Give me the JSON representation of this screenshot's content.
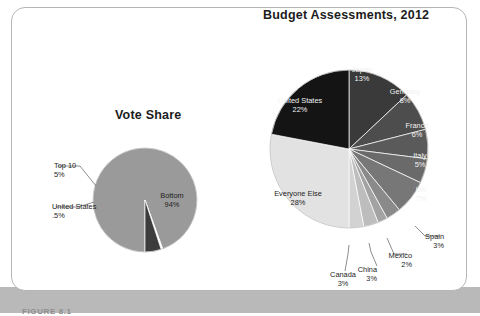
{
  "figure": {
    "caption": "FIGURE 8.1",
    "card_border_color": "#b5b5b5",
    "band_color": "#b9b9b9"
  },
  "chart_data": [
    {
      "type": "pie",
      "title": "Vote Share",
      "id": "vote-share",
      "center": [
        145,
        200
      ],
      "radius": 52,
      "start_angle_deg": 180,
      "direction": "clockwise",
      "categories": [
        "Bottom",
        "United States",
        "Top 10"
      ],
      "values": [
        94,
        0.5,
        5
      ],
      "value_labels": [
        "94%",
        ".5%",
        "5%"
      ],
      "colors": [
        "#9a9a9a",
        "#ffffff",
        "#3c3c3c"
      ],
      "slices": [
        {
          "name": "Bottom",
          "value": 94,
          "value_label": "94%",
          "color": "#9a9a9a",
          "label_mode": "inside",
          "label_color": "#1d1d1d",
          "label_xy": [
            172,
            196
          ]
        },
        {
          "name": "United States",
          "value": 0.5,
          "value_label": ".5%",
          "color": "#ffffff",
          "label_mode": "callout",
          "label_color": "#1d1d1d",
          "text_xy": [
            52,
            209
          ],
          "leader": [
            [
              56,
              207
            ],
            [
              78,
              207
            ],
            [
              94,
              202
            ]
          ]
        },
        {
          "name": "Top 10",
          "value": 5,
          "value_label": "5%",
          "color": "#3c3c3c",
          "label_mode": "callout",
          "label_color": "#1d1d1d",
          "text_xy": [
            54,
            168
          ],
          "leader": [
            [
              58,
              166
            ],
            [
              80,
              166
            ],
            [
              96,
              186
            ]
          ]
        }
      ],
      "legend": "none",
      "grid": false
    },
    {
      "type": "pie",
      "title": "Budget Assessments, 2012",
      "id": "budget-assessments",
      "center": [
        349,
        149
      ],
      "radius": 79,
      "start_angle_deg": 0,
      "direction": "clockwise",
      "categories": [
        "Japan",
        "Germany",
        "France",
        "Italy",
        "UK",
        "Spain",
        "Mexico",
        "China",
        "Canada",
        "Everyone Else",
        "United States"
      ],
      "values": [
        13,
        8,
        6,
        5,
        7,
        3,
        2,
        3,
        3,
        28,
        22
      ],
      "value_labels": [
        "13%",
        "8%",
        "6%",
        "5%",
        "7%",
        "3%",
        "2%",
        "3%",
        "3%",
        "28%",
        "22%"
      ],
      "colors": [
        "#3a3a3a",
        "#4d4d4d",
        "#5a5a5a",
        "#6a6a6a",
        "#777777",
        "#8a8a8a",
        "#a3a3a3",
        "#bdbdbd",
        "#d2d2d2",
        "#e2e2e2",
        "#141414"
      ],
      "slices": [
        {
          "name": "Japan",
          "value": 13,
          "value_label": "13%",
          "color": "#3a3a3a",
          "label_mode": "inside",
          "label_color": "#f2f2f2",
          "label_xy": [
            362,
            70
          ]
        },
        {
          "name": "Germany",
          "value": 8,
          "value_label": "8%",
          "color": "#4d4d4d",
          "label_mode": "inside",
          "label_color": "#f2f2f2",
          "label_xy": [
            405,
            92
          ]
        },
        {
          "name": "France",
          "value": 6,
          "value_label": "6%",
          "color": "#5a5a5a",
          "label_mode": "inside",
          "label_color": "#f2f2f2",
          "label_xy": [
            417,
            126
          ]
        },
        {
          "name": "Italy",
          "value": 5,
          "value_label": "5%",
          "color": "#6a6a6a",
          "label_mode": "inside",
          "label_color": "#f2f2f2",
          "label_xy": [
            420,
            156
          ]
        },
        {
          "name": "UK",
          "value": 7,
          "value_label": "7%",
          "color": "#777777",
          "label_mode": "inside",
          "label_color": "#f2f2f2",
          "label_xy": [
            421,
            190
          ]
        },
        {
          "name": "Spain",
          "value": 3,
          "value_label": "3%",
          "color": "#8a8a8a",
          "label_mode": "callout",
          "label_color": "#1d1d1d",
          "text_xy": [
            444,
            239
          ],
          "leader": [
            [
              440,
              236
            ],
            [
              425,
              236
            ],
            [
              415,
              226
            ]
          ]
        },
        {
          "name": "Mexico",
          "value": 2,
          "value_label": "2%",
          "color": "#a3a3a3",
          "label_mode": "callout",
          "label_color": "#1d1d1d",
          "text_xy": [
            412,
            258
          ],
          "leader": [
            [
              407,
              254
            ],
            [
              394,
              254
            ],
            [
              387,
              238
            ]
          ]
        },
        {
          "name": "China",
          "value": 3,
          "value_label": "3%",
          "color": "#bdbdbd",
          "label_mode": "callout",
          "label_color": "#1d1d1d",
          "text_xy": [
            377,
            272
          ],
          "leader": [
            [
              377,
              266
            ],
            [
              371,
              252
            ],
            [
              369,
              243
            ]
          ]
        },
        {
          "name": "Canada",
          "value": 3,
          "value_label": "3%",
          "color": "#d2d2d2",
          "label_mode": "callout",
          "label_color": "#1d1d1d",
          "text_xy": [
            343,
            277
          ],
          "leader": [
            [
              345,
              271
            ],
            [
              348,
              254
            ],
            [
              349,
              245
            ]
          ]
        },
        {
          "name": "Everyone Else",
          "value": 28,
          "value_label": "28%",
          "color": "#e2e2e2",
          "label_mode": "inside",
          "label_color": "#1d1d1d",
          "label_xy": [
            298,
            194
          ]
        },
        {
          "name": "United States",
          "value": 22,
          "value_label": "22%",
          "color": "#141414",
          "label_mode": "inside",
          "label_color": "#f2f2f2",
          "label_xy": [
            300,
            101
          ]
        }
      ],
      "legend": "none",
      "grid": false
    }
  ]
}
